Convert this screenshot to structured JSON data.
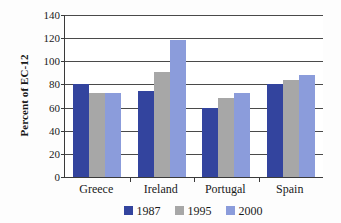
{
  "chart_data": {
    "type": "bar",
    "title": "",
    "xlabel": "",
    "ylabel": "Percent of EC-12",
    "categories": [
      "Greece",
      "Ireland",
      "Portugal",
      "Spain"
    ],
    "series": [
      {
        "name": "1987",
        "color": "#33449e",
        "values": [
          80,
          74,
          60,
          80.5
        ]
      },
      {
        "name": "1995",
        "color": "#a7a7a7",
        "values": [
          72.5,
          91,
          68,
          84
        ]
      },
      {
        "name": "2000",
        "color": "#8b9cdb",
        "values": [
          73,
          118,
          72.5,
          88
        ]
      }
    ],
    "ylim": [
      0,
      140
    ],
    "yticks": [
      0,
      20,
      40,
      60,
      80,
      100,
      120,
      140
    ],
    "ytick_labels": [
      "0",
      "20",
      "40",
      "60",
      "80",
      "100",
      "120",
      "140"
    ],
    "grid": true,
    "legend_position": "bottom"
  },
  "axis": {
    "y_title": "Percent of EC-12"
  }
}
